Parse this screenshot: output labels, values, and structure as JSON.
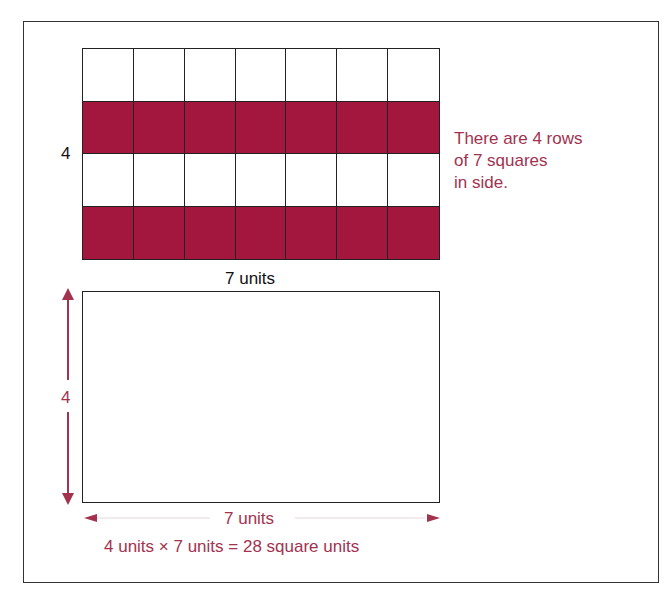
{
  "diagram": {
    "colors": {
      "shaded": "#a3173f",
      "annotation": "#a3324f",
      "line": "#222222"
    },
    "grid": {
      "rows": 4,
      "columns": 7,
      "row_fills": [
        "plain",
        "shaded",
        "plain",
        "shaded"
      ],
      "side_label": "4",
      "bottom_label": "7 units"
    },
    "note": {
      "lines": [
        "There are 4 rows",
        "of 7 squares",
        "in side."
      ]
    },
    "rectangle": {
      "height_label": "4",
      "width_label": "7 units",
      "formula": "4 units × 7 units = 28 square units"
    }
  }
}
